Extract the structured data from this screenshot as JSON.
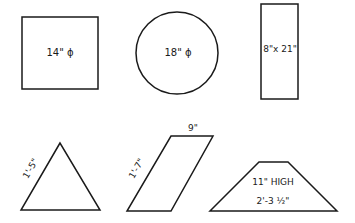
{
  "diagram": {
    "shapes": [
      {
        "type": "square",
        "label": "14\" ɸ"
      },
      {
        "type": "circle",
        "label": "18\" ɸ"
      },
      {
        "type": "rectangle",
        "label": "8\"x 21\""
      },
      {
        "type": "triangle",
        "side_label": "1'-5\""
      },
      {
        "type": "parallelogram",
        "side_label": "1'-7\"",
        "top_label": "9\""
      },
      {
        "type": "trapezoid",
        "height_label": "11\" HIGH",
        "base_label": "2'-3 ½\""
      }
    ]
  }
}
